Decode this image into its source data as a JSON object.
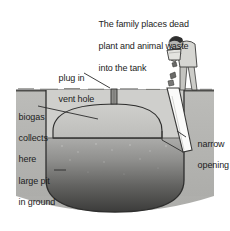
{
  "figure": {
    "background_color": "#ffffff"
  },
  "caption": {
    "line1": "The family places dead",
    "line2": "plant and animal waste",
    "line3": "into the tank"
  },
  "labels": {
    "vent": {
      "line1": "plug in",
      "line2": "vent hole"
    },
    "biogas": {
      "line1": "biogas",
      "line2": "collects",
      "line3": "here"
    },
    "pit": {
      "line1": "large pit",
      "line2": "in ground"
    },
    "opening": {
      "line1": "narrow",
      "line2": "opening"
    }
  },
  "colors": {
    "ground_soil": "#b9b9b6",
    "ground_line": "#4a4a48",
    "dome_gas": "#c9c9c6",
    "slurry_top": "#a9a9a6",
    "slurry_bottom": "#3d3d3c",
    "chute_fill": "#fbfbfa",
    "outline": "#2b2b2b",
    "text": "#1c1c1c",
    "person_skin": "#b5b5b2",
    "person_hair": "#2e2e2e",
    "person_cloth": "#d6d6d2"
  },
  "scene": {
    "ground_level_y": 90,
    "dome_apex_y": 104,
    "slurry_line_y": 138,
    "pit_bottom_y": 210
  }
}
